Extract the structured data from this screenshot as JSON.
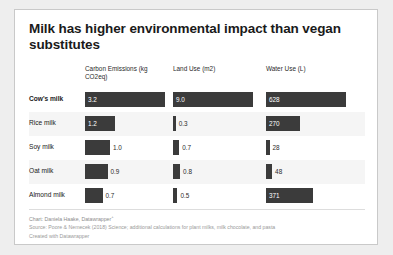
{
  "card": {
    "title": "Milk has higher environmental impact than vegan substitutes"
  },
  "footer": {
    "credit": "Chart: Daniela Haake, Datawrapper",
    "credit_superscript": "+",
    "source": "Source: Poore & Nemecek (2018) Science; additional calculations for plant milks, milk chocolate, and pasta",
    "created": "Created with Datawrapper"
  },
  "colors": {
    "bar": "#3b3b3b",
    "band": "#f5f5f5",
    "card_bg": "#ffffff",
    "page_bg": "#eeeeee",
    "border": "#c9c9c9",
    "title_text": "#1a1a1a",
    "footer_text": "#9a9a9a"
  },
  "chart_data": {
    "type": "bar",
    "title": "Milk has higher environmental impact than vegan substitutes",
    "layout": "small-multiples-grid",
    "orientation": "horizontal",
    "grid": false,
    "legend": "none",
    "categories": [
      "Cow's milk",
      "Rice milk",
      "Soy milk",
      "Oat milk",
      "Almond milk"
    ],
    "highlighted_category": "Cow's milk",
    "series": [
      {
        "name": "Carbon Emissions (kg CO2eq)",
        "unit": "kg CO2eq",
        "values": [
          3.2,
          1.2,
          1.0,
          0.9,
          0.7
        ],
        "labels": [
          "3.2",
          "1.2",
          "1.0",
          "0.9",
          "0.7"
        ],
        "max": 3.2
      },
      {
        "name": "Land Use (m2)",
        "unit": "m2",
        "values": [
          9.0,
          0.3,
          0.7,
          0.8,
          0.5
        ],
        "labels": [
          "9.0",
          "0.3",
          "0.7",
          "0.8",
          "0.5"
        ],
        "max": 9.0
      },
      {
        "name": "Water Use (L)",
        "unit": "L",
        "values": [
          628,
          270,
          28,
          48,
          371
        ],
        "labels": [
          "628",
          "270",
          "28",
          "48",
          "371"
        ],
        "max": 628
      }
    ],
    "xlabel": "",
    "ylabel": ""
  }
}
